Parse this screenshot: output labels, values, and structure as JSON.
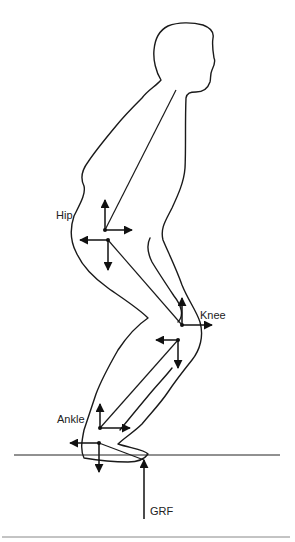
{
  "figure": {
    "labels": {
      "hip": "Hip",
      "knee": "Knee",
      "ankle": "Ankle",
      "grf": "GRF"
    },
    "joints": [
      {
        "name": "hip",
        "x": 105,
        "y": 230
      },
      {
        "name": "knee",
        "x": 182,
        "y": 325
      },
      {
        "name": "ankle",
        "x": 100,
        "y": 428
      }
    ],
    "colors": {
      "line": "#1a1a1a",
      "background": "#ffffff",
      "rule": "#888888"
    }
  }
}
